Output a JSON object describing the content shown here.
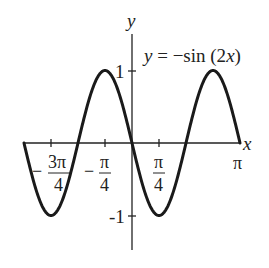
{
  "chart_data": {
    "type": "line",
    "title": "y = −sin (2x)",
    "function": "-sin(2x)",
    "xlabel": "x",
    "ylabel": "y",
    "xlim": [
      -3.14159,
      3.14159
    ],
    "ylim": [
      -1.5,
      1.5
    ],
    "grid": false,
    "x_ticks": [
      {
        "value": -2.35619,
        "label_sign": "−",
        "label_num": "3π",
        "label_den": "4"
      },
      {
        "value": -0.785398,
        "label_sign": "−",
        "label_num": "π",
        "label_den": "4"
      },
      {
        "value": 0.785398,
        "label_sign": "",
        "label_num": "π",
        "label_den": "4"
      },
      {
        "value": 3.14159,
        "label_sign": "",
        "label_num": "π",
        "label_den": ""
      }
    ],
    "y_ticks": [
      {
        "value": 1,
        "label": "1"
      },
      {
        "value": -1,
        "label": "-1"
      }
    ],
    "key_points": [
      {
        "x": -3.14159,
        "y": 0
      },
      {
        "x": -2.35619,
        "y": -1
      },
      {
        "x": -1.5708,
        "y": 0
      },
      {
        "x": -0.785398,
        "y": 1
      },
      {
        "x": 0,
        "y": 0
      },
      {
        "x": 0.785398,
        "y": -1
      },
      {
        "x": 1.5708,
        "y": 0
      },
      {
        "x": 2.35619,
        "y": 1
      },
      {
        "x": 3.14159,
        "y": 0
      }
    ],
    "annotation": {
      "text_y": "y",
      "text_eq": " = −sin (2",
      "text_x": "x",
      "text_close": ")"
    }
  }
}
